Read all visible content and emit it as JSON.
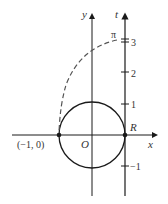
{
  "diagram": {
    "axes": {
      "x_label": "x",
      "y_label": "y",
      "t_label": "t",
      "origin_label": "O"
    },
    "t_axis_ticks": [
      "3",
      "2",
      "1",
      "−1"
    ],
    "pi_label": "π",
    "point_left_label": "(−1, 0)",
    "point_right_label": "R",
    "colors": {
      "stroke": "#1a1a1a",
      "dashed": "#555555",
      "text": "#333333"
    }
  }
}
